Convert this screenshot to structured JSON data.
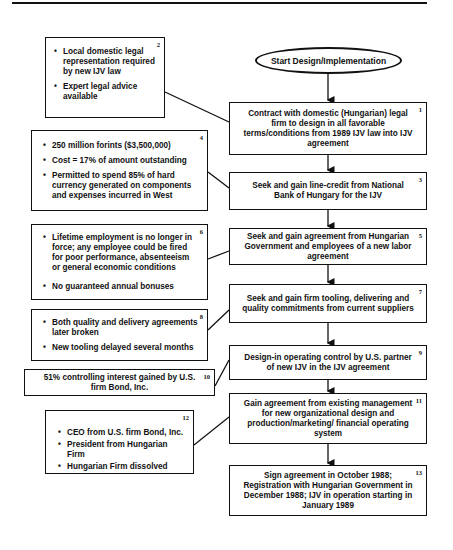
{
  "diagram": {
    "start": {
      "label": "Start Design/Implementation"
    },
    "steps": [
      {
        "number": "1",
        "text": "Contract with domestic (Hungarian) legal firm to design in all favorable terms/conditions from 1989 IJV law into IJV agreement"
      },
      {
        "number": "3",
        "text": "Seek and gain line-credit from National Bank of Hungary for the IJV"
      },
      {
        "number": "5",
        "text": "Seek and gain agreement from Hungarian Government and employees of a new labor agreement"
      },
      {
        "number": "7",
        "text": "Seek and gain firm tooling, delivering and quality commitments from current suppliers"
      },
      {
        "number": "9",
        "text": "Design-in operating control by U.S. partner of new IJV in the IJV agreement"
      },
      {
        "number": "11",
        "text": "Gain agreement from existing management for new organizational design and production/marketing/ financial operating system"
      },
      {
        "number": "13",
        "text": "Sign agreement in October 1988; Registration with Hungarian Government in December 1988; IJV in operation starting in January 1989"
      }
    ],
    "notes": [
      {
        "number": "2",
        "attached_to": "1",
        "bullets": [
          "Local domestic legal representation required by new IJV law",
          "Expert legal advice available"
        ]
      },
      {
        "number": "4",
        "attached_to": "3",
        "bullets": [
          "250 million forints ($3,500,000)",
          "Cost = 17% of amount outstanding",
          "Permitted to spend 85% of hard currency generated on components and expenses incurred in West"
        ]
      },
      {
        "number": "6",
        "attached_to": "5",
        "bullets": [
          "Lifetime employment is no longer in force; any employee could be fired for poor performance, absenteeism or general economic conditions",
          "No guaranteed annual bonuses"
        ]
      },
      {
        "number": "8",
        "attached_to": "7",
        "bullets": [
          "Both quality and delivery agreements later broken",
          "New tooling delayed several months"
        ]
      },
      {
        "number": "10",
        "attached_to": "9",
        "text": "51% controlling interest gained by U.S. firm Bond, Inc."
      },
      {
        "number": "12",
        "attached_to": "11",
        "bullets": [
          "CEO from U.S. firm Bond, Inc.",
          "President from Hungarian Firm",
          "Hungarian Firm dissolved"
        ]
      }
    ]
  }
}
